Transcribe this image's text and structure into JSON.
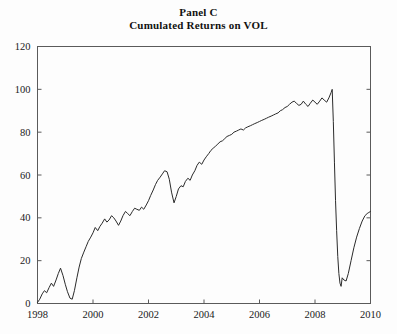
{
  "figure": {
    "title_line1": "Panel C",
    "title_line2": "Cumulated Returns on VOL",
    "background_color": "#fdfdfd",
    "frame_color": "#5a5a5a",
    "line_color": "#2b2b2b"
  },
  "chart_data": {
    "type": "line",
    "title": "Panel C\nCumulated Returns on VOL",
    "xlabel": "",
    "ylabel": "",
    "xlim": [
      1998,
      2010
    ],
    "ylim": [
      0,
      120
    ],
    "xticks": [
      1998,
      2000,
      2002,
      2004,
      2006,
      2008,
      2010
    ],
    "xtick_labels": [
      "1998",
      "2000",
      "2002",
      "2004",
      "2006",
      "2008",
      "2010"
    ],
    "yticks": [
      0,
      20,
      40,
      60,
      80,
      100,
      120
    ],
    "ytick_labels": [
      "0",
      "20",
      "40",
      "60",
      "80",
      "100",
      "120"
    ],
    "grid": false,
    "legend": null,
    "series": [
      {
        "name": "Cumulated Returns on VOL",
        "color": "#2b2b2b",
        "x": [
          1998.0,
          1998.08,
          1998.17,
          1998.25,
          1998.33,
          1998.42,
          1998.5,
          1998.58,
          1998.67,
          1998.75,
          1998.83,
          1998.92,
          1999.0,
          1999.08,
          1999.17,
          1999.25,
          1999.33,
          1999.42,
          1999.5,
          1999.58,
          1999.67,
          1999.75,
          1999.83,
          1999.92,
          2000.0,
          2000.08,
          2000.17,
          2000.25,
          2000.33,
          2000.42,
          2000.5,
          2000.58,
          2000.67,
          2000.75,
          2000.83,
          2000.92,
          2001.0,
          2001.08,
          2001.17,
          2001.25,
          2001.33,
          2001.42,
          2001.5,
          2001.58,
          2001.67,
          2001.75,
          2001.83,
          2001.92,
          2002.0,
          2002.08,
          2002.17,
          2002.25,
          2002.33,
          2002.42,
          2002.5,
          2002.58,
          2002.67,
          2002.75,
          2002.83,
          2002.92,
          2003.0,
          2003.08,
          2003.17,
          2003.25,
          2003.33,
          2003.42,
          2003.5,
          2003.58,
          2003.67,
          2003.75,
          2003.83,
          2003.92,
          2004.0,
          2004.08,
          2004.17,
          2004.25,
          2004.33,
          2004.42,
          2004.5,
          2004.58,
          2004.67,
          2004.75,
          2004.83,
          2004.92,
          2005.0,
          2005.08,
          2005.17,
          2005.25,
          2005.33,
          2005.42,
          2005.5,
          2005.58,
          2005.67,
          2005.75,
          2005.83,
          2005.92,
          2006.0,
          2006.08,
          2006.17,
          2006.25,
          2006.33,
          2006.42,
          2006.5,
          2006.58,
          2006.67,
          2006.75,
          2006.83,
          2006.92,
          2007.0,
          2007.08,
          2007.17,
          2007.25,
          2007.33,
          2007.42,
          2007.5,
          2007.58,
          2007.67,
          2007.75,
          2007.83,
          2007.92,
          2008.0,
          2008.08,
          2008.17,
          2008.25,
          2008.33,
          2008.42,
          2008.5,
          2008.58,
          2008.62,
          2008.66,
          2008.7,
          2008.74,
          2008.78,
          2008.82,
          2008.86,
          2008.9,
          2008.94,
          2008.98,
          2009.04,
          2009.12,
          2009.2,
          2009.3,
          2009.4,
          2009.5,
          2009.6,
          2009.7,
          2009.8,
          2009.88,
          2009.94,
          2010.0
        ],
        "y": [
          0.5,
          2.0,
          4.5,
          6.0,
          5.0,
          7.5,
          9.5,
          8.0,
          11.0,
          14.0,
          16.5,
          13.0,
          9.0,
          5.5,
          2.5,
          2.0,
          6.0,
          12.0,
          17.0,
          21.0,
          24.0,
          26.5,
          29.0,
          31.0,
          33.0,
          35.5,
          34.0,
          36.0,
          37.5,
          39.5,
          38.0,
          39.0,
          41.0,
          40.0,
          38.5,
          36.5,
          38.5,
          41.0,
          43.0,
          42.0,
          41.0,
          43.0,
          44.5,
          44.0,
          43.5,
          45.0,
          44.0,
          46.0,
          48.0,
          50.5,
          53.0,
          55.5,
          57.5,
          59.0,
          60.5,
          62.0,
          61.5,
          58.0,
          52.0,
          47.0,
          50.0,
          53.5,
          55.0,
          54.5,
          57.0,
          58.5,
          57.5,
          60.0,
          62.0,
          64.5,
          66.0,
          65.0,
          67.0,
          68.5,
          70.0,
          71.5,
          72.5,
          73.5,
          74.5,
          75.5,
          76.0,
          77.0,
          78.0,
          78.5,
          79.0,
          80.0,
          80.5,
          81.0,
          81.5,
          81.0,
          82.0,
          82.5,
          83.0,
          83.5,
          84.0,
          84.5,
          85.0,
          85.5,
          86.0,
          86.5,
          87.0,
          87.5,
          88.0,
          88.5,
          89.0,
          90.0,
          90.5,
          91.5,
          92.0,
          93.0,
          94.0,
          94.5,
          93.5,
          92.5,
          93.0,
          94.5,
          93.0,
          92.0,
          93.5,
          95.0,
          94.0,
          93.0,
          94.5,
          96.0,
          95.0,
          94.0,
          96.0,
          98.5,
          100.0,
          85.0,
          66.0,
          48.0,
          34.0,
          22.0,
          14.0,
          9.5,
          8.0,
          12.0,
          11.0,
          10.5,
          14.0,
          20.0,
          26.0,
          31.0,
          35.0,
          38.5,
          41.0,
          42.0,
          42.5,
          43.0
        ]
      }
    ]
  }
}
